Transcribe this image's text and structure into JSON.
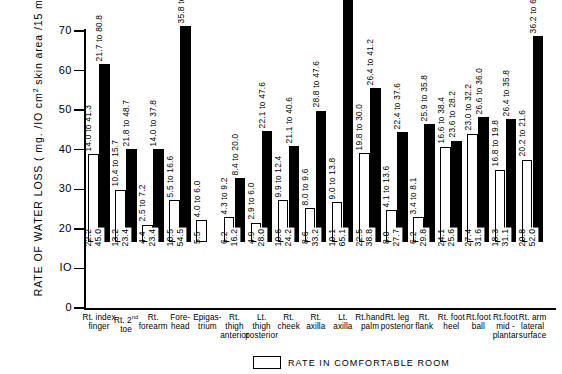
{
  "chart_data": {
    "type": "bar",
    "title": "",
    "ylabel": "RATE OF WATER LOSS (mg./IO cm2 skin area/15 min)",
    "ylabel_prefix": "RATE  OF  WATER  LOSS  ( mg. /IO cm",
    "ylabel_sup": "2",
    "ylabel_suffix": " skin area /15 min)",
    "xlabel": "",
    "ylim": [
      0,
      70
    ],
    "yticks": [
      0,
      10,
      20,
      30,
      40,
      50,
      60,
      70
    ],
    "ytick_labels": [
      "0",
      "IO",
      "20",
      "30",
      "40",
      "50",
      "60",
      "70"
    ],
    "grid": false,
    "legend_position": "bottom",
    "legend": [
      {
        "key": "comfortable",
        "label": "RATE IN COMFORTABLE ROOM",
        "fill": "#ffffff"
      }
    ],
    "series": [
      {
        "name": "Rate in comfortable room",
        "key": "comfortable",
        "fill": "#ffffff"
      },
      {
        "name": "Rate during stress",
        "key": "stress",
        "fill": "#000000"
      }
    ],
    "categories": [
      "Rt. index finger",
      "Rt. 2nd toe",
      "Rt. forearm",
      "Forehead",
      "Epigastrium",
      "Rt. thigh anterior",
      "Lt. thigh posterior",
      "Rt. cheek",
      "Rt. axilla",
      "Lt. axilla",
      "Rt. hand palm",
      "Rt. leg posterior",
      "Rt. flank",
      "Rt. foot heel",
      "Rt. foot ball",
      "Rt. foot mid-plantar",
      "Rt. arm lateral surface"
    ],
    "category_lines": [
      [
        "Rt. index",
        "finger"
      ],
      [
        "Rt. 2",
        "toe"
      ],
      [
        "Rt.",
        "forearm"
      ],
      [
        "Fore-",
        "head"
      ],
      [
        "Epigas-",
        "trium"
      ],
      [
        "Rt.",
        "thigh",
        "anterior"
      ],
      [
        "Lt.",
        "thigh",
        "posterior"
      ],
      [
        "Rt.",
        "cheek"
      ],
      [
        "Rt.",
        "axilla"
      ],
      [
        "Lt.",
        "axilla"
      ],
      [
        "Rt.hand",
        "palm"
      ],
      [
        "Rt. leg",
        "posterior"
      ],
      [
        "Rt.",
        "flank"
      ],
      [
        "Rt. foot",
        "heel"
      ],
      [
        "Rt.foot",
        "ball"
      ],
      [
        "Rt.foot",
        "mid -",
        "plantar"
      ],
      [
        "Rt. arm",
        "lateral",
        "surface"
      ]
    ],
    "bars": [
      {
        "category": "Rt. index finger",
        "comfortable": 22.2,
        "comfortable_range": "14.0 to 41.3",
        "stress": 45.0,
        "stress_range": "21.7 to 80.8"
      },
      {
        "category": "Rt. 2nd toe",
        "comfortable": 13.2,
        "comfortable_range": "10.4 to 15.7",
        "stress": 23.4,
        "stress_range": "21.8 to 48.7"
      },
      {
        "category": "Rt. forearm",
        "comfortable": 4.4,
        "comfortable_range": "2.5 to 7.2",
        "stress": 23.4,
        "stress_range": "14.0 to 37.8"
      },
      {
        "category": "Forehead",
        "comfortable": 10.5,
        "comfortable_range": "5.5 to 16.6",
        "stress": 54.5,
        "stress_range": "35.8 to 73.2"
      },
      {
        "category": "Epigastrium",
        "comfortable": 5.5,
        "comfortable_range": "4.0 to 6.0",
        "stress": null,
        "stress_range": ""
      },
      {
        "category": "Rt. thigh anterior",
        "comfortable": 6.2,
        "comfortable_range": "4.3 to 9.2",
        "stress": 16.2,
        "stress_range": "8.4 to 20.0"
      },
      {
        "category": "Lt. thigh posterior",
        "comfortable": 4.9,
        "comfortable_range": "2.9 to 6.0",
        "stress": 28.0,
        "stress_range": "22.1 to 47.6"
      },
      {
        "category": "Rt. cheek",
        "comfortable": 10.6,
        "comfortable_range": "9.9 to 12.4",
        "stress": 24.2,
        "stress_range": "21.1 to 40.6"
      },
      {
        "category": "Rt. axilla",
        "comfortable": 8.6,
        "comfortable_range": "8.0 to 9.6",
        "stress": 33.2,
        "stress_range": "28.8 to 47.6"
      },
      {
        "category": "Lt. axilla",
        "comfortable": 10.1,
        "comfortable_range": "9.0 to 13.8",
        "stress": 65.1,
        "stress_range": "21.2 to 99.6"
      },
      {
        "category": "Rt. hand palm",
        "comfortable": 22.5,
        "comfortable_range": "19.8 to 30.0",
        "stress": 38.8,
        "stress_range": "26.4 to 41.2"
      },
      {
        "category": "Rt. leg posterior",
        "comfortable": 8.0,
        "comfortable_range": "4.1 to 13.6",
        "stress": 27.7,
        "stress_range": "22.4 to 37.6"
      },
      {
        "category": "Rt. flank",
        "comfortable": 6.2,
        "comfortable_range": "3.4 to 8.1",
        "stress": 29.8,
        "stress_range": "25.9 to 35.8"
      },
      {
        "category": "Rt. foot heel",
        "comfortable": 24.1,
        "comfortable_range": "16.6 to 38.4",
        "stress": 25.6,
        "stress_range": "23.6 to 28.2"
      },
      {
        "category": "Rt. foot ball",
        "comfortable": 27.4,
        "comfortable_range": "23.0 to 32.2",
        "stress": 31.6,
        "stress_range": "26.6 to 36.0"
      },
      {
        "category": "Rt. foot mid-plantar",
        "comfortable": 18.3,
        "comfortable_range": "16.8 to 19.8",
        "stress": 31.1,
        "stress_range": "26.4 to 35.8"
      },
      {
        "category": "Rt. arm lateral surface",
        "comfortable": 20.8,
        "comfortable_range": "20.2 to 21.6",
        "stress": 52.0,
        "stress_range": "36.2 to 67.8"
      }
    ]
  }
}
